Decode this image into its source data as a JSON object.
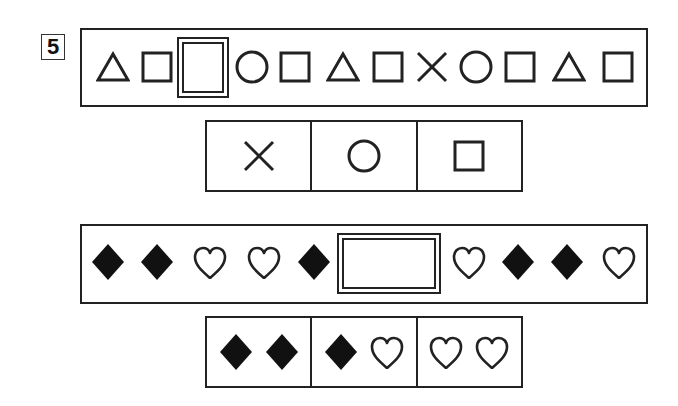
{
  "question_number": "5",
  "puzzle1": {
    "sequence": [
      "triangle",
      "square",
      "blank",
      "circle",
      "square",
      "triangle",
      "square",
      "cross",
      "circle",
      "square",
      "triangle",
      "square"
    ],
    "choices": [
      [
        "cross"
      ],
      [
        "circle"
      ],
      [
        "square"
      ]
    ]
  },
  "puzzle2": {
    "sequence": [
      "diamond",
      "diamond",
      "heart",
      "heart",
      "diamond",
      "blank",
      "heart",
      "diamond",
      "diamond",
      "heart"
    ],
    "choices": [
      [
        "diamond",
        "diamond"
      ],
      [
        "diamond",
        "heart"
      ],
      [
        "heart",
        "heart"
      ]
    ]
  },
  "colors": {
    "stroke": "#222222",
    "fill": "#111111",
    "background": "#ffffff"
  }
}
